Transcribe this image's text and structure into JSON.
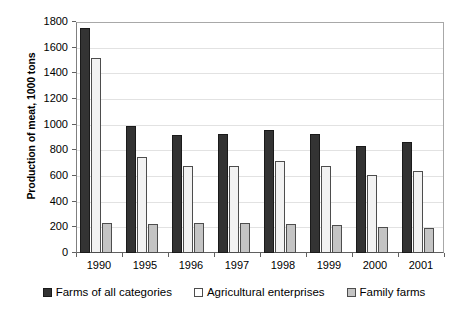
{
  "chart_data": {
    "type": "bar",
    "title": "",
    "subtitle": "",
    "xlabel": "",
    "ylabel": "Production of meat, 1000 tons",
    "ylim": [
      0,
      1800
    ],
    "yticks": [
      0,
      200,
      400,
      600,
      800,
      1000,
      1200,
      1400,
      1600,
      1800
    ],
    "ytick_labels": [
      "0",
      "200",
      "400",
      "600",
      "800",
      "1000",
      "1200",
      "1400",
      "1600",
      "1800"
    ],
    "grid": true,
    "grid_axis": "y",
    "legend_position": "bottom",
    "categories": [
      "1990",
      "1995",
      "1996",
      "1997",
      "1998",
      "1999",
      "2000",
      "2001"
    ],
    "series": [
      {
        "name": "Farms of all categories",
        "color": "#333333",
        "values": [
          1750,
          990,
          920,
          925,
          960,
          930,
          830,
          865
        ]
      },
      {
        "name": "Agricultural enterprises",
        "color": "#f2f2f2",
        "values": [
          1520,
          750,
          680,
          675,
          715,
          675,
          605,
          640
        ]
      },
      {
        "name": "Family farms",
        "color": "#c4c4c4",
        "values": [
          232,
          228,
          230,
          235,
          228,
          218,
          205,
          195
        ]
      }
    ]
  },
  "legend": {
    "items": [
      {
        "label": "Farms of all categories"
      },
      {
        "label": "Agricultural enterprises"
      },
      {
        "label": "Family farms"
      }
    ]
  }
}
